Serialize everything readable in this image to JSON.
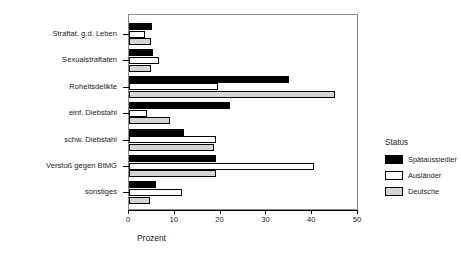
{
  "chart_data": {
    "type": "bar",
    "orientation": "horizontal",
    "title": "",
    "xlabel": "Prozent",
    "ylabel": "",
    "xlim": [
      0,
      50
    ],
    "xticks": [
      0,
      10,
      20,
      30,
      40,
      50
    ],
    "grid": false,
    "legend": {
      "title": "Status",
      "position": "right",
      "entries": [
        "Spätaussiedler",
        "Ausländer",
        "Deutsche"
      ]
    },
    "categories": [
      "Straftat. g.d. Leben",
      "Sexualstraftaten",
      "Roheitsdelikte",
      "einf. Diebstahl",
      "schw. Diebstahl",
      "Verstoß gegen BtMG",
      "sonstiges"
    ],
    "series": [
      {
        "name": "Spätaussiedler",
        "color": "#000000",
        "values": [
          5.0,
          5.3,
          35.0,
          22.0,
          12.0,
          19.0,
          6.0
        ]
      },
      {
        "name": "Ausländer",
        "color": "#ffffff",
        "values": [
          3.5,
          6.5,
          19.5,
          4.0,
          19.0,
          40.5,
          11.5
        ]
      },
      {
        "name": "Deutsche",
        "color": "#d4d4d4",
        "values": [
          4.8,
          4.8,
          45.0,
          9.0,
          18.5,
          19.0,
          4.5
        ]
      }
    ]
  }
}
